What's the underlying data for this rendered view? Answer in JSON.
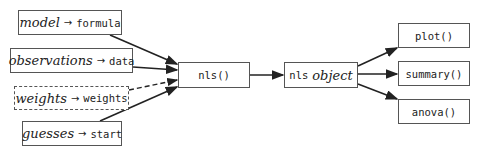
{
  "diagram": {
    "inputs": [
      {
        "concept": "model",
        "argument": "formula",
        "style": "solid"
      },
      {
        "concept": "observations",
        "argument": "data",
        "style": "solid"
      },
      {
        "concept": "weights",
        "argument": "weights",
        "style": "dashed"
      },
      {
        "concept": "guesses",
        "argument": "start",
        "style": "solid"
      }
    ],
    "arrow_glyph": "→",
    "function": {
      "label": "nls()"
    },
    "result": {
      "code": "nls",
      "text": "object"
    },
    "methods": [
      {
        "label": "plot()"
      },
      {
        "label": "summary()"
      },
      {
        "label": "anova()"
      }
    ],
    "colors": {
      "line": "#222222",
      "border": "#555555",
      "background": "#ffffff"
    }
  }
}
